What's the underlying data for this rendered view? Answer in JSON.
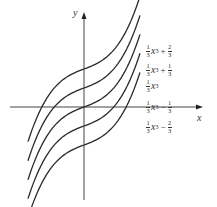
{
  "chart_data": {
    "type": "line",
    "title": "",
    "xlabel": "x",
    "ylabel": "y",
    "grid": false,
    "legend_position": "inline-right",
    "x_range": [
      -1.5,
      1.5
    ],
    "series": [
      {
        "name": "1/3 x^3 + 2/3",
        "offset": 0.6667,
        "label_num": "1",
        "label_den": "3",
        "op": "+",
        "c_num": "2",
        "c_den": "3"
      },
      {
        "name": "1/3 x^3 + 1/3",
        "offset": 0.3333,
        "label_num": "1",
        "label_den": "3",
        "op": "+",
        "c_num": "1",
        "c_den": "3"
      },
      {
        "name": "1/3 x^3",
        "offset": 0,
        "label_num": "1",
        "label_den": "3",
        "op": "",
        "c_num": "",
        "c_den": ""
      },
      {
        "name": "1/3 x^3 - 1/3",
        "offset": -0.3333,
        "label_num": "1",
        "label_den": "3",
        "op": "−",
        "c_num": "1",
        "c_den": "3"
      },
      {
        "name": "1/3 x^3 - 2/3",
        "offset": -0.6667,
        "label_num": "1",
        "label_den": "3",
        "op": "−",
        "c_num": "2",
        "c_den": "3"
      }
    ]
  },
  "axes": {
    "x_label": "x",
    "y_label": "y"
  },
  "colors": {
    "curve": "#2a2a2a",
    "axis": "#444444",
    "background": "#ffffff"
  }
}
